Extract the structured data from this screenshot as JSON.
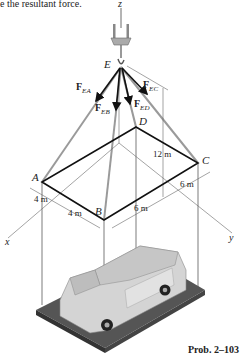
{
  "header": {
    "partial_text": "e the resultant force."
  },
  "caption": "Prob. 2–103",
  "axes": {
    "z": "z",
    "x": "x",
    "y": "y"
  },
  "points": {
    "E": "E",
    "A": "A",
    "B": "B",
    "C": "C",
    "D": "D"
  },
  "forces": [
    {
      "symbol": "F",
      "sub": "EA"
    },
    {
      "symbol": "F",
      "sub": "EB"
    },
    {
      "symbol": "F",
      "sub": "EC"
    },
    {
      "symbol": "F",
      "sub": "ED"
    }
  ],
  "dimensions": {
    "height": "12 m",
    "ab_a": "4 m",
    "ab_b": "4 m",
    "bc_near": "6 m",
    "bc_far": "6 m"
  },
  "colors": {
    "frame": "#111111",
    "cable": "#999999",
    "platform": "#555555",
    "car_body": "#d6d6d6"
  }
}
